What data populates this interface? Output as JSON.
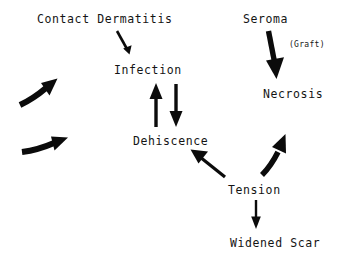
{
  "diagram": {
    "background_color": "#ffffff",
    "ink_color": "#0b0b0b",
    "nodes": [
      {
        "id": "contact_dermatitis",
        "label": "Contact Dermatitis",
        "x": 37,
        "y": 14,
        "size": "normal"
      },
      {
        "id": "seroma",
        "label": "Seroma",
        "x": 243,
        "y": 14,
        "size": "normal"
      },
      {
        "id": "graft",
        "label": "(Graft)",
        "x": 289,
        "y": 41,
        "size": "small"
      },
      {
        "id": "infection",
        "label": "Infection",
        "x": 114,
        "y": 65,
        "size": "normal"
      },
      {
        "id": "necrosis",
        "label": "Necrosis",
        "x": 263,
        "y": 89,
        "size": "normal"
      },
      {
        "id": "dehiscence",
        "label": "Dehiscence",
        "x": 133,
        "y": 136,
        "size": "normal"
      },
      {
        "id": "tension",
        "label": "Tension",
        "x": 228,
        "y": 185,
        "size": "normal"
      },
      {
        "id": "widened_scar",
        "label": "Widened Scar",
        "x": 230,
        "y": 238,
        "size": "normal"
      }
    ],
    "edges": [
      {
        "id": "dermatitis-to-infection",
        "from": "contact_dermatitis",
        "to": "infection",
        "style": "straight-thin"
      },
      {
        "id": "seroma-to-necrosis",
        "from": "seroma",
        "to": "necrosis",
        "style": "straight-thick"
      },
      {
        "id": "dehiscence-to-infection",
        "from": "dehiscence",
        "to": "infection",
        "style": "vertical-up"
      },
      {
        "id": "infection-to-dehiscence",
        "from": "infection",
        "to": "dehiscence",
        "style": "vertical-down"
      },
      {
        "id": "tension-to-dehiscence",
        "from": "tension",
        "to": "dehiscence",
        "style": "diagonal-up-left"
      },
      {
        "id": "tension-to-necrosis",
        "from": "tension",
        "to": "necrosis",
        "style": "curved-up-right"
      },
      {
        "id": "tension-to-widened-scar",
        "from": "tension",
        "to": "widened_scar",
        "style": "vertical-down"
      },
      {
        "id": "external-to-infection",
        "from": "external",
        "to": "infection",
        "style": "curved-up-right"
      },
      {
        "id": "external-to-dehiscence",
        "from": "external",
        "to": "dehiscence",
        "style": "curved-right"
      }
    ]
  }
}
